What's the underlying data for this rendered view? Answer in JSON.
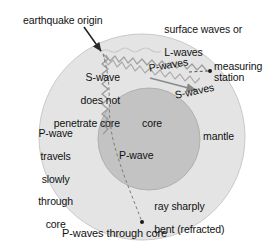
{
  "figure": {
    "type": "diagram",
    "cut_off_header": "",
    "background_color": "#ffffff",
    "mantle_color": "#e3e3e3",
    "core_color": "#c2c2c2",
    "ink_color": "#111111"
  },
  "labels": {
    "earthquake_origin": "earthquake origin",
    "surface_waves_line1": "surface waves or",
    "surface_waves_line2": "L-waves",
    "s_wave_no_penetrate_line1": "S-wave",
    "s_wave_no_penetrate_line2": "does not",
    "s_wave_no_penetrate_line3": "penetrate core",
    "p_waves": "P-waves",
    "measuring": "measuring",
    "station": "station",
    "s_waves": "S-waves",
    "p_wave_slow_line1": "P-wave",
    "p_wave_slow_line2": "travels",
    "p_wave_slow_line3": "slowly",
    "p_wave_slow_line4": "through",
    "p_wave_slow_line5": "core",
    "core": "core",
    "mantle": "mantle",
    "p_wave_in_core": "P-wave",
    "ray_bent_line1": "ray sharply",
    "ray_bent_line2": "bent (refracted)",
    "p_waves_through_core": "P-waves through core"
  },
  "markers": {
    "origin_point": "earthquake-focus",
    "station_point": "measuring-station-dot",
    "antipode_point": "antipodal-station-dot"
  },
  "geometry": {
    "earth_center_x": 142,
    "earth_center_y": 137,
    "earth_radius": 103,
    "core_center_x": 149,
    "core_center_y": 139,
    "core_radius": 51
  }
}
